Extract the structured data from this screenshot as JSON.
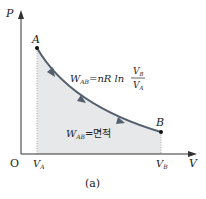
{
  "diagram": {
    "axes": {
      "y_label": "P",
      "x_label": "V",
      "origin_label": "O"
    },
    "points": {
      "a_label": "A",
      "b_label": "B"
    },
    "ticks": {
      "va_main": "V",
      "va_sub": "A",
      "vb_main": "V",
      "vb_sub": "B"
    },
    "formula": {
      "lhs_main": "W",
      "lhs_sub": "AB",
      "rhs": "=nR ln",
      "num_main": "V",
      "num_sub": "B",
      "den_main": "V",
      "den_sub": "A"
    },
    "area_label": {
      "main": "W",
      "sub": "AB",
      "text": "=면적"
    },
    "caption": "(a)",
    "colors": {
      "curve": "#55606e",
      "area": "#e6e8ea",
      "axis": "#333333"
    }
  }
}
